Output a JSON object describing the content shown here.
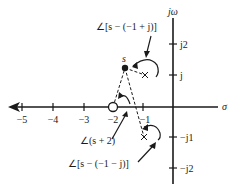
{
  "axes": {
    "vertical_label": "jω",
    "horizontal_label": "σ",
    "real_ticks": [
      "−5",
      "−4",
      "−3",
      "−2",
      "−1"
    ],
    "imag_ticks": [
      "j2",
      "j",
      "−j1",
      "−j2"
    ]
  },
  "points": {
    "test_point_label": "s"
  },
  "annotations": {
    "angle_upper_pole": "∠[s − (−1 + j)]",
    "angle_zero": "∠(s + 2)",
    "angle_lower_pole": "∠[s − (−1 − j)]"
  },
  "colors": {
    "stroke": "#1a1a1a",
    "background": "#ffffff"
  }
}
